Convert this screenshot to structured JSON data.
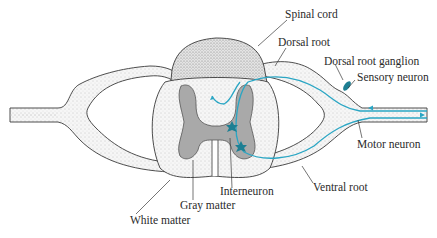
{
  "colors": {
    "outline": "#3a3a3a",
    "stipple": "#e9e9e9",
    "gray_matter": "#a9a9a9",
    "neuron": "#2aa6c4",
    "neuron_dark": "#1d7f93",
    "text": "#2a2a2a"
  },
  "labels": {
    "spinal_cord": "Spinal cord",
    "dorsal_root": "Dorsal root",
    "dorsal_root_ganglion": "Dorsal root ganglion",
    "sensory_neuron": "Sensory neuron",
    "motor_neuron": "Motor neuron",
    "ventral_root": "Ventral root",
    "interneuron": "Interneuron",
    "gray_matter": "Gray matter",
    "white_matter": "White matter"
  }
}
